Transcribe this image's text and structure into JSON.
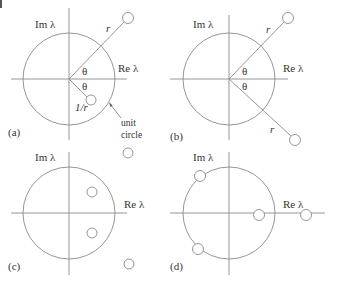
{
  "figure": {
    "axis_labels": {
      "imag": "Im λ",
      "real": "Re λ"
    },
    "colors": {
      "line": "#8a8a8a",
      "text": "#333333",
      "background": "#ffffff"
    },
    "panels": [
      {
        "id": "a",
        "label": "(a)",
        "annotations": {
          "r": "r",
          "theta_upper": "θ",
          "theta_lower": "θ",
          "inverse_r": "1/r",
          "unit_1": "unit",
          "unit_2": "circle"
        }
      },
      {
        "id": "b",
        "label": "(b)",
        "annotations": {
          "r_upper": "r",
          "r_lower": "r",
          "theta_upper": "θ",
          "theta_lower": "θ"
        }
      },
      {
        "id": "c",
        "label": "(c)"
      },
      {
        "id": "d",
        "label": "(d)"
      }
    ]
  }
}
